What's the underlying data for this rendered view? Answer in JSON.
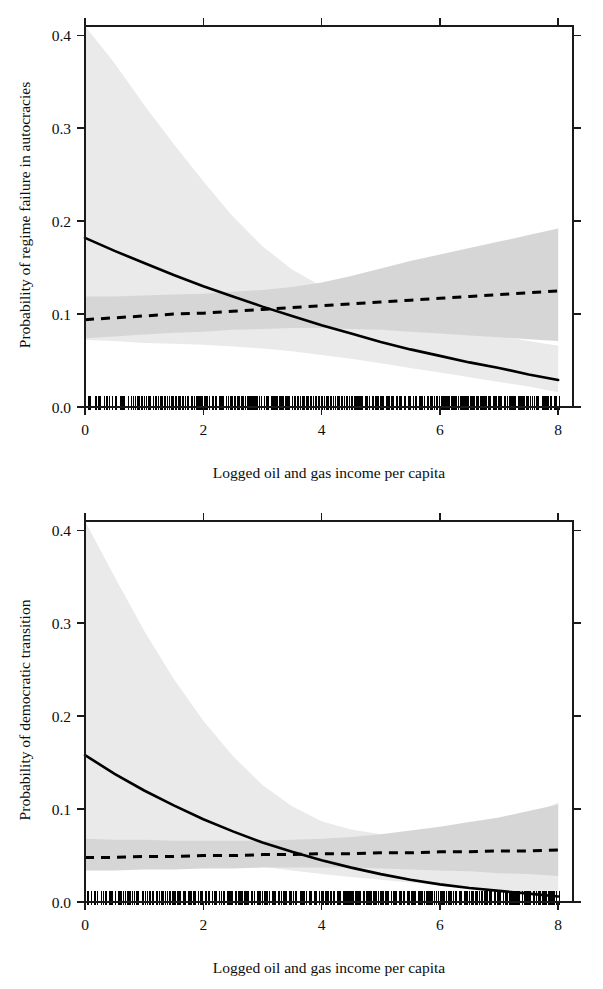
{
  "figure": {
    "panel_count": 2,
    "background_color": "#ffffff",
    "line_color": "#000000",
    "band_wide_color": "#eaeaea",
    "band_narrow_color": "#d6d6d6"
  },
  "panels": [
    {
      "id": "regime-failure",
      "ylabel": "Probability of regime failure in autocracies",
      "xlabel": "Logged oil and gas income per capita",
      "xticks": [
        "0",
        "2",
        "4",
        "6",
        "8"
      ],
      "yticks": [
        "0.0",
        "0.1",
        "0.2",
        "0.3",
        "0.4"
      ]
    },
    {
      "id": "democratic-transition",
      "ylabel": "Probability of democratic transition",
      "xlabel": "Logged oil and gas income per capita",
      "xticks": [
        "0",
        "2",
        "4",
        "6",
        "8"
      ],
      "yticks": [
        "0.0",
        "0.1",
        "0.2",
        "0.3",
        "0.4"
      ]
    }
  ],
  "chart_data": [
    {
      "type": "line",
      "title": "",
      "xlabel": "Logged oil and gas income per capita",
      "ylabel": "Probability of regime failure in autocracies",
      "xlim": [
        0,
        8.25
      ],
      "ylim": [
        0.0,
        0.41
      ],
      "xticks": [
        0,
        2,
        4,
        6,
        8
      ],
      "yticks": [
        0.0,
        0.1,
        0.2,
        0.3,
        0.4
      ],
      "grid": false,
      "legend": "none",
      "x": [
        0,
        0.5,
        1,
        1.5,
        2,
        2.5,
        3,
        3.5,
        4,
        4.5,
        5,
        5.5,
        6,
        6.5,
        7,
        7.5,
        8
      ],
      "series": [
        {
          "name": "solid-curve",
          "style": "solid",
          "values": [
            0.182,
            0.168,
            0.155,
            0.142,
            0.13,
            0.119,
            0.108,
            0.098,
            0.088,
            0.079,
            0.07,
            0.062,
            0.055,
            0.048,
            0.042,
            0.035,
            0.029
          ],
          "ci_upper": [
            0.412,
            0.37,
            0.325,
            0.283,
            0.243,
            0.205,
            0.173,
            0.148,
            0.13,
            0.117,
            0.107,
            0.098,
            0.09,
            0.083,
            0.077,
            0.071,
            0.066
          ],
          "ci_lower": [
            0.072,
            0.071,
            0.069,
            0.068,
            0.067,
            0.065,
            0.063,
            0.06,
            0.056,
            0.052,
            0.047,
            0.042,
            0.037,
            0.032,
            0.027,
            0.022,
            0.016
          ],
          "ci_band": "wide"
        },
        {
          "name": "dashed-curve",
          "style": "dashed",
          "values": [
            0.094,
            0.096,
            0.098,
            0.1,
            0.101,
            0.103,
            0.105,
            0.107,
            0.109,
            0.111,
            0.113,
            0.115,
            0.117,
            0.119,
            0.121,
            0.123,
            0.125
          ],
          "ci_upper": [
            0.119,
            0.119,
            0.12,
            0.121,
            0.122,
            0.124,
            0.126,
            0.129,
            0.134,
            0.141,
            0.149,
            0.157,
            0.164,
            0.171,
            0.178,
            0.185,
            0.192
          ],
          "ci_lower": [
            0.074,
            0.076,
            0.078,
            0.08,
            0.081,
            0.083,
            0.084,
            0.085,
            0.085,
            0.084,
            0.083,
            0.081,
            0.079,
            0.077,
            0.075,
            0.073,
            0.071
          ],
          "ci_band": "narrow"
        }
      ],
      "rug": {
        "position": "bottom",
        "value": 0.0,
        "description": "dense data rug along x axis from 0 to 8"
      }
    },
    {
      "type": "line",
      "title": "",
      "xlabel": "Logged oil and gas income per capita",
      "ylabel": "Probability of democratic transition",
      "xlim": [
        0,
        8.25
      ],
      "ylim": [
        0.0,
        0.41
      ],
      "xticks": [
        0,
        2,
        4,
        6,
        8
      ],
      "yticks": [
        0.0,
        0.1,
        0.2,
        0.3,
        0.4
      ],
      "grid": false,
      "legend": "none",
      "x": [
        0,
        0.5,
        1,
        1.5,
        2,
        2.5,
        3,
        3.5,
        4,
        4.5,
        5,
        5.5,
        6,
        6.5,
        7,
        7.5,
        8
      ],
      "series": [
        {
          "name": "solid-curve",
          "style": "solid",
          "values": [
            0.158,
            0.138,
            0.12,
            0.104,
            0.089,
            0.076,
            0.064,
            0.054,
            0.045,
            0.037,
            0.03,
            0.024,
            0.019,
            0.015,
            0.012,
            0.009,
            0.006
          ],
          "ci_upper": [
            0.412,
            0.35,
            0.292,
            0.24,
            0.195,
            0.157,
            0.126,
            0.103,
            0.087,
            0.078,
            0.073,
            0.071,
            0.072,
            0.076,
            0.083,
            0.093,
            0.107
          ],
          "ci_lower": [
            0.06,
            0.057,
            0.054,
            0.05,
            0.046,
            0.042,
            0.038,
            0.034,
            0.03,
            0.027,
            0.024,
            0.021,
            0.018,
            0.015,
            0.012,
            0.01,
            0.007
          ],
          "ci_band": "wide"
        },
        {
          "name": "dashed-curve",
          "style": "dashed",
          "values": [
            0.048,
            0.048,
            0.049,
            0.049,
            0.05,
            0.05,
            0.051,
            0.051,
            0.052,
            0.052,
            0.053,
            0.053,
            0.054,
            0.054,
            0.055,
            0.055,
            0.056
          ],
          "ci_upper": [
            0.068,
            0.067,
            0.067,
            0.066,
            0.066,
            0.066,
            0.066,
            0.067,
            0.068,
            0.07,
            0.073,
            0.077,
            0.081,
            0.086,
            0.091,
            0.098,
            0.105
          ],
          "ci_lower": [
            0.034,
            0.034,
            0.035,
            0.035,
            0.036,
            0.036,
            0.037,
            0.037,
            0.037,
            0.037,
            0.036,
            0.035,
            0.034,
            0.033,
            0.031,
            0.03,
            0.028
          ],
          "ci_band": "narrow"
        }
      ],
      "rug": {
        "position": "bottom",
        "value": 0.0,
        "description": "dense data rug along x axis from 0 to 8"
      }
    }
  ]
}
